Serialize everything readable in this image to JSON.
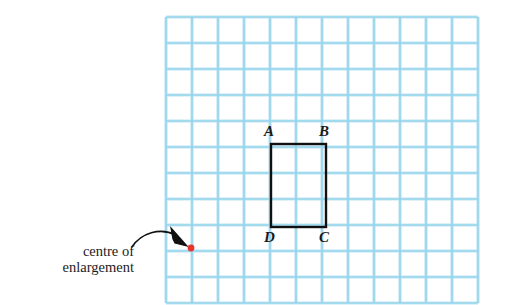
{
  "figure": {
    "background_color": "#ffffff",
    "caption": {
      "line1": "centre of",
      "line2": "enlargement"
    },
    "grid": {
      "line_color": "#8ad0ea",
      "line_color_light": "#bfe4f3",
      "columns": 12,
      "rows": 11,
      "cell_size": 26,
      "origin_x": 166,
      "origin_y": 17
    },
    "shape": {
      "name": "rectangle-ABCD",
      "stroke_color": "#111111",
      "stroke_width": 2.4,
      "left": 271,
      "top": 144,
      "right": 326,
      "bottom": 227,
      "width_cells": 2,
      "height_cells": 3.2
    },
    "vertices": [
      {
        "label": "A",
        "x": 264,
        "y": 124,
        "corner": "top-left"
      },
      {
        "label": "B",
        "x": 319,
        "y": 124,
        "corner": "top-right"
      },
      {
        "label": "D",
        "x": 264,
        "y": 230,
        "corner": "bottom-left"
      },
      {
        "label": "C",
        "x": 319,
        "y": 230,
        "corner": "bottom-right"
      }
    ],
    "centre_point": {
      "label": "centre of enlargement",
      "color": "#e8352b",
      "x": 191,
      "y": 248,
      "radius": 3.4
    },
    "arrow": {
      "color": "#111111",
      "stroke_width": 1.6,
      "tail_x": 132,
      "tail_y": 247,
      "tip_x": 186,
      "tip_y": 244
    }
  }
}
